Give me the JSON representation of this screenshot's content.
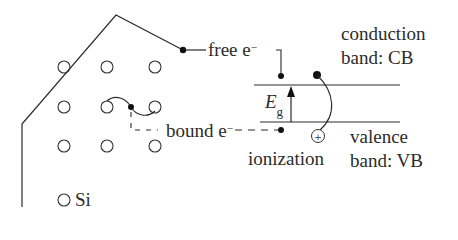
{
  "diagram": {
    "labels": {
      "free_electron": "free e",
      "free_electron_sup": "−",
      "bound_electron": "bound e",
      "bound_electron_sup": "−",
      "conduction_band_line1": "conduction",
      "conduction_band_line2": "band: CB",
      "valence_band_line1": "valence",
      "valence_band_line2": "band: VB",
      "ionization": "ionization",
      "band_gap": "E",
      "band_gap_sub": "g",
      "silicon_legend": "Si",
      "hole_symbol": "+"
    },
    "lattice": {
      "rows": 3,
      "cols": 3,
      "atom": "Si"
    },
    "colors": {
      "line": "#2a2a2a",
      "background": "#ffffff"
    }
  }
}
